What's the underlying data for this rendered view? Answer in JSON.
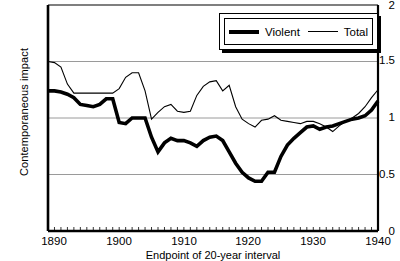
{
  "chart_data": {
    "type": "line",
    "title": "",
    "xlabel": "Endpoint of 20-year interval",
    "ylabel": "Contemporaneous impact",
    "xlim": [
      1889,
      1940
    ],
    "ylim": [
      0,
      2
    ],
    "xticks": [
      1890,
      1900,
      1910,
      1920,
      1930,
      1940
    ],
    "yticks": [
      "0",
      "0.5",
      "1",
      "1.5",
      "2"
    ],
    "ytick_values": [
      0,
      0.5,
      1,
      1.5,
      2
    ],
    "gridlines": [
      0.5,
      1,
      1.5
    ],
    "grid": true,
    "legend_position": "top-right",
    "minor_xticks_interval": 1,
    "x": [
      1889,
      1890,
      1891,
      1892,
      1893,
      1894,
      1895,
      1896,
      1897,
      1898,
      1899,
      1900,
      1901,
      1902,
      1903,
      1904,
      1905,
      1906,
      1907,
      1908,
      1909,
      1910,
      1911,
      1912,
      1913,
      1914,
      1915,
      1916,
      1917,
      1918,
      1919,
      1920,
      1921,
      1922,
      1923,
      1924,
      1925,
      1926,
      1927,
      1928,
      1929,
      1930,
      1931,
      1932,
      1933,
      1934,
      1935,
      1936,
      1937,
      1938,
      1939,
      1940
    ],
    "series": [
      {
        "name": "Violent",
        "style": "thick",
        "color": "#000000",
        "values": [
          1.24,
          1.24,
          1.23,
          1.21,
          1.18,
          1.12,
          1.11,
          1.1,
          1.12,
          1.17,
          1.17,
          0.96,
          0.95,
          1.0,
          1.0,
          1.0,
          0.83,
          0.7,
          0.78,
          0.82,
          0.8,
          0.8,
          0.78,
          0.75,
          0.8,
          0.83,
          0.84,
          0.8,
          0.7,
          0.6,
          0.52,
          0.47,
          0.44,
          0.44,
          0.52,
          0.52,
          0.66,
          0.76,
          0.82,
          0.87,
          0.92,
          0.93,
          0.9,
          0.92,
          0.93,
          0.95,
          0.97,
          0.99,
          1.0,
          1.02,
          1.07,
          1.15
        ]
      },
      {
        "name": "Total",
        "style": "thin",
        "color": "#000000",
        "values": [
          1.5,
          1.49,
          1.45,
          1.3,
          1.22,
          1.22,
          1.22,
          1.22,
          1.22,
          1.22,
          1.22,
          1.26,
          1.36,
          1.4,
          1.4,
          1.24,
          0.99,
          1.05,
          1.1,
          1.12,
          1.06,
          1.05,
          1.06,
          1.2,
          1.28,
          1.32,
          1.33,
          1.24,
          1.29,
          1.1,
          0.99,
          0.95,
          0.92,
          0.98,
          0.99,
          1.02,
          0.98,
          0.97,
          0.96,
          0.95,
          0.97,
          0.97,
          0.95,
          0.92,
          0.88,
          0.93,
          0.97,
          1.0,
          1.04,
          1.1,
          1.18,
          1.25
        ]
      }
    ]
  },
  "legend": {
    "entries": [
      {
        "label": "Violent"
      },
      {
        "label": "Total"
      }
    ]
  }
}
